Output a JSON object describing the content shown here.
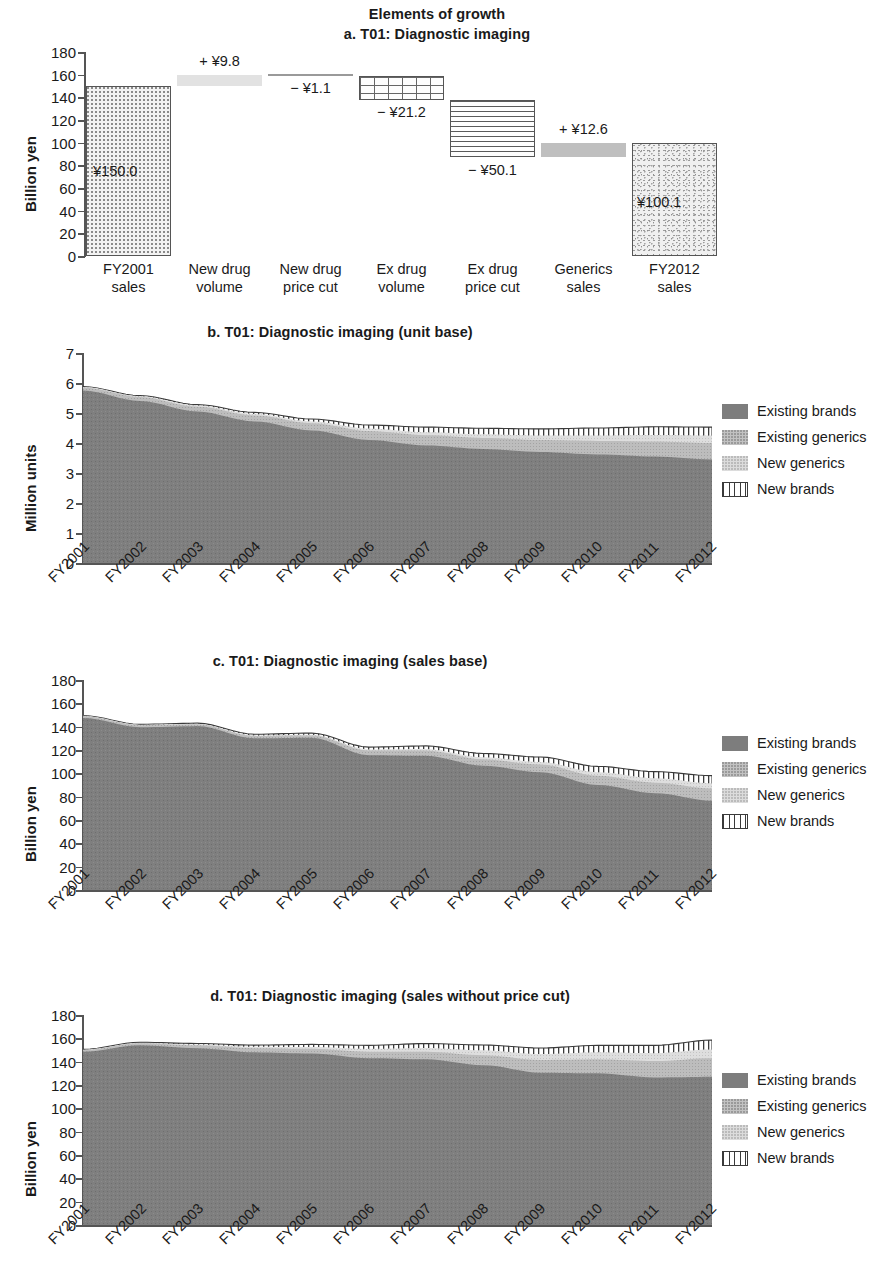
{
  "figure": {
    "suptitle": "Elements of growth"
  },
  "panel_a": {
    "title": "a. T01: Diagnostic imaging",
    "ylabel": "Billion yen",
    "yticks": [
      "180",
      "160",
      "140",
      "120",
      "100",
      "80",
      "60",
      "40",
      "20",
      "0"
    ],
    "categories": [
      "FY2001\nsales",
      "New drug\nvolume",
      "New drug\nprice cut",
      "Ex drug\nvolume",
      "Ex drug\nprice cut",
      "Generics\nsales",
      "FY2012\nsales"
    ],
    "category_lines": [
      [
        "FY2001",
        "sales"
      ],
      [
        "New drug",
        "volume"
      ],
      [
        "New drug",
        "price cut"
      ],
      [
        "Ex drug",
        "volume"
      ],
      [
        "Ex drug",
        "price cut"
      ],
      [
        "Generics",
        "sales"
      ],
      [
        "FY2012",
        "sales"
      ]
    ],
    "bar_labels": [
      "¥150.0",
      "+ ¥9.8",
      "− ¥1.1",
      "− ¥21.2",
      "− ¥50.1",
      "+ ¥12.6",
      "¥100.1"
    ],
    "chart_data": {
      "type": "bar",
      "subtype": "waterfall",
      "title": "a. T01: Diagnostic imaging",
      "xlabel": "",
      "ylabel": "Billion yen",
      "ylim": [
        0,
        180
      ],
      "ytick_step": 20,
      "grid": false,
      "categories": [
        "FY2001 sales",
        "New drug volume",
        "New drug price cut",
        "Ex drug volume",
        "Ex drug price cut",
        "Generics sales",
        "FY2012 sales"
      ],
      "values": [
        150.0,
        9.8,
        -1.1,
        -21.2,
        -50.1,
        12.6,
        100.1
      ],
      "is_total": [
        true,
        false,
        false,
        false,
        false,
        false,
        true
      ],
      "cumulative_start": [
        0,
        150.0,
        159.8,
        158.7,
        137.5,
        87.4,
        0
      ],
      "cumulative_end": [
        150.0,
        159.8,
        158.7,
        137.5,
        87.4,
        100.0,
        100.1
      ],
      "data_labels": [
        "¥150.0",
        "+ ¥9.8",
        "− ¥1.1",
        "− ¥21.2",
        "− ¥50.1",
        "+ ¥12.6",
        "¥100.1"
      ],
      "fill_patterns": [
        "dots",
        "solid-light",
        "solid-light",
        "grid",
        "horizontal-lines",
        "gray",
        "noise"
      ]
    }
  },
  "panel_b": {
    "title": "b. T01: Diagnostic imaging (unit base)",
    "ylabel": "Million units",
    "yticks": [
      "7",
      "6",
      "5",
      "4",
      "3",
      "2",
      "1",
      "0"
    ],
    "legend": [
      {
        "label": "Existing brands",
        "swatch": "sw-exbrand"
      },
      {
        "label": "Existing generics",
        "swatch": "sw-exgen"
      },
      {
        "label": "New generics",
        "swatch": "sw-newgen"
      },
      {
        "label": "New brands",
        "swatch": "sw-newbrand"
      }
    ],
    "xticks": [
      "FY2001",
      "FY2002",
      "FY2003",
      "FY2004",
      "FY2005",
      "FY2006",
      "FY2007",
      "FY2008",
      "FY2009",
      "FY2010",
      "FY2011",
      "FY2012"
    ],
    "chart_data": {
      "type": "area",
      "stacked": true,
      "title": "b. T01: Diagnostic imaging (unit base)",
      "xlabel": "",
      "ylabel": "Million units",
      "ylim": [
        0,
        7
      ],
      "ytick_step": 1,
      "grid": false,
      "legend_position": "right",
      "x": [
        "FY2001",
        "FY2002",
        "FY2003",
        "FY2004",
        "FY2005",
        "FY2006",
        "FY2007",
        "FY2008",
        "FY2009",
        "FY2010",
        "FY2011",
        "FY2012"
      ],
      "series": [
        {
          "name": "Existing brands",
          "values": [
            5.75,
            5.4,
            5.05,
            4.72,
            4.42,
            4.1,
            3.92,
            3.8,
            3.7,
            3.62,
            3.55,
            3.45
          ]
        },
        {
          "name": "Existing generics",
          "values": [
            0.1,
            0.13,
            0.16,
            0.2,
            0.24,
            0.3,
            0.34,
            0.37,
            0.4,
            0.45,
            0.5,
            0.55
          ]
        },
        {
          "name": "New generics",
          "values": [
            0.02,
            0.03,
            0.04,
            0.05,
            0.06,
            0.08,
            0.1,
            0.12,
            0.15,
            0.18,
            0.22,
            0.25
          ]
        },
        {
          "name": "New brands",
          "values": [
            0.01,
            0.02,
            0.03,
            0.05,
            0.08,
            0.12,
            0.17,
            0.2,
            0.22,
            0.25,
            0.27,
            0.28
          ]
        }
      ],
      "totals": [
        5.88,
        5.58,
        5.28,
        5.02,
        4.8,
        4.6,
        4.53,
        4.49,
        4.47,
        4.5,
        4.54,
        4.53
      ]
    }
  },
  "panel_c": {
    "title": "c. T01: Diagnostic imaging (sales base)",
    "ylabel": "Billion yen",
    "yticks": [
      "180",
      "160",
      "140",
      "120",
      "100",
      "80",
      "60",
      "40",
      "20",
      "0"
    ],
    "legend": [
      {
        "label": "Existing brands",
        "swatch": "sw-exbrand"
      },
      {
        "label": "Existing generics",
        "swatch": "sw-exgen"
      },
      {
        "label": "New generics",
        "swatch": "sw-newgen"
      },
      {
        "label": "New brands",
        "swatch": "sw-newbrand"
      }
    ],
    "xticks": [
      "FY2001",
      "FY2002",
      "FY2003",
      "FY2004",
      "FY2005",
      "FY2006",
      "FY2007",
      "FY2008",
      "FY2009",
      "FY2010",
      "FY2011",
      "FY2012"
    ],
    "chart_data": {
      "type": "area",
      "stacked": true,
      "title": "c. T01: Diagnostic imaging (sales base)",
      "xlabel": "",
      "ylabel": "Billion yen",
      "ylim": [
        0,
        180
      ],
      "ytick_step": 20,
      "grid": false,
      "legend_position": "right",
      "x": [
        "FY2001",
        "FY2002",
        "FY2003",
        "FY2004",
        "FY2005",
        "FY2006",
        "FY2007",
        "FY2008",
        "FY2009",
        "FY2010",
        "FY2011",
        "FY2012"
      ],
      "series": [
        {
          "name": "Existing brands",
          "values": [
            147.5,
            139.5,
            140.5,
            130.0,
            130.5,
            115.5,
            115.0,
            106.5,
            101.0,
            90.0,
            83.0,
            76.5
          ]
        },
        {
          "name": "Existing generics",
          "values": [
            1.5,
            1.8,
            1.5,
            2.0,
            2.0,
            4.0,
            4.5,
            5.5,
            6.5,
            8.0,
            9.0,
            10.5
          ]
        },
        {
          "name": "New generics",
          "values": [
            0.3,
            0.4,
            0.4,
            0.5,
            0.6,
            1.0,
            1.3,
            1.7,
            2.2,
            3.0,
            3.8,
            4.5
          ]
        },
        {
          "name": "New brands",
          "values": [
            0.2,
            0.3,
            0.6,
            1.0,
            1.4,
            2.0,
            2.7,
            3.3,
            4.3,
            5.0,
            5.7,
            6.5
          ]
        }
      ],
      "totals": [
        149.5,
        142.0,
        143.0,
        133.5,
        134.5,
        122.5,
        123.5,
        117.0,
        114.0,
        106.0,
        101.5,
        98.0
      ]
    }
  },
  "panel_d": {
    "title": "d. T01: Diagnostic imaging (sales without price cut)",
    "ylabel": "Billion yen",
    "yticks": [
      "180",
      "160",
      "140",
      "120",
      "100",
      "80",
      "60",
      "40",
      "20",
      "0"
    ],
    "legend": [
      {
        "label": "Existing brands",
        "swatch": "sw-exbrand"
      },
      {
        "label": "Existing generics",
        "swatch": "sw-exgen"
      },
      {
        "label": "New generics",
        "swatch": "sw-newgen"
      },
      {
        "label": "New brands",
        "swatch": "sw-newbrand"
      }
    ],
    "xticks": [
      "FY2001",
      "FY2002",
      "FY2003",
      "FY2004",
      "FY2005",
      "FY2006",
      "FY2007",
      "FY2008",
      "FY2009",
      "FY2010",
      "FY2011",
      "FY2012"
    ],
    "chart_data": {
      "type": "area",
      "stacked": true,
      "title": "d. T01: Diagnostic imaging (sales without price cut)",
      "xlabel": "",
      "ylabel": "Billion yen",
      "ylim": [
        0,
        180
      ],
      "ytick_step": 20,
      "grid": false,
      "legend_position": "right",
      "x": [
        "FY2001",
        "FY2002",
        "FY2003",
        "FY2004",
        "FY2005",
        "FY2006",
        "FY2007",
        "FY2008",
        "FY2009",
        "FY2010",
        "FY2011",
        "FY2012"
      ],
      "series": [
        {
          "name": "Existing brands",
          "values": [
            148.5,
            154.0,
            151.5,
            148.0,
            147.0,
            143.0,
            142.0,
            137.0,
            130.5,
            130.0,
            126.5,
            127.0
          ]
        },
        {
          "name": "Existing generics",
          "values": [
            1.5,
            1.8,
            2.5,
            3.5,
            4.0,
            5.5,
            6.5,
            8.5,
            11.0,
            12.0,
            14.0,
            16.0
          ]
        },
        {
          "name": "New generics",
          "values": [
            0.3,
            0.4,
            0.7,
            1.2,
            1.6,
            2.5,
            3.2,
            4.2,
            5.0,
            6.0,
            6.8,
            7.5
          ]
        },
        {
          "name": "New brands",
          "values": [
            0.2,
            0.4,
            0.9,
            1.5,
            2.2,
            3.0,
            3.8,
            4.6,
            5.2,
            6.0,
            6.7,
            8.0
          ]
        }
      ],
      "totals": [
        150.5,
        156.6,
        155.6,
        154.2,
        154.8,
        154.0,
        155.5,
        154.3,
        151.7,
        154.0,
        154.0,
        158.5
      ]
    }
  }
}
